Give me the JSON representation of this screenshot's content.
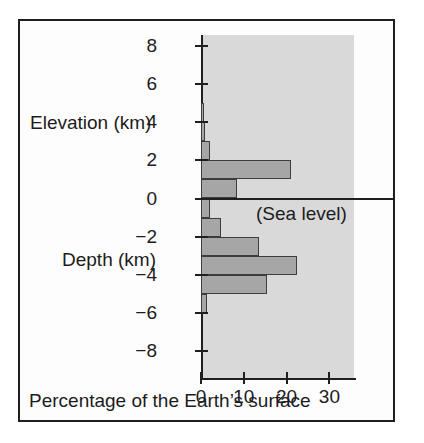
{
  "chart_data": {
    "type": "bar",
    "orientation": "horizontal",
    "title": "",
    "xlabel": "Percentage of the Earth's surface",
    "ylabel_upper": "Elevation (km)",
    "ylabel_lower": "Depth (km)",
    "xlim": [
      0,
      36
    ],
    "ylim": [
      -9,
      9
    ],
    "xticks": [
      0,
      10,
      20,
      30
    ],
    "xtick_labels": [
      "0",
      "10",
      "20",
      "30"
    ],
    "yticks": [
      8,
      6,
      4,
      2,
      0,
      -2,
      -4,
      -6,
      -8
    ],
    "ytick_labels": [
      "8",
      "6",
      "4",
      "2",
      "0",
      "−2",
      "−4",
      "−6",
      "−8"
    ],
    "grid": false,
    "legend": "none",
    "annotations": [
      {
        "text": "(Sea level)",
        "y": 0
      }
    ],
    "bins": [
      {
        "label": "5 to 4",
        "y_low": 4,
        "y_high": 5,
        "value": 0.8
      },
      {
        "label": "4 to 3",
        "y_low": 3,
        "y_high": 4,
        "value": 1.0
      },
      {
        "label": "3 to 2",
        "y_low": 2,
        "y_high": 3,
        "value": 2.2
      },
      {
        "label": "2 to 1",
        "y_low": 1,
        "y_high": 2,
        "value": 21.0
      },
      {
        "label": "1 to 0",
        "y_low": 0,
        "y_high": 1,
        "value": 8.5
      },
      {
        "label": "0 to -1",
        "y_low": -1,
        "y_high": 0,
        "value": 2.0
      },
      {
        "label": "-1 to -2",
        "y_low": -2,
        "y_high": -1,
        "value": 4.7
      },
      {
        "label": "-2 to -3",
        "y_low": -3,
        "y_high": -2,
        "value": 13.5
      },
      {
        "label": "-3 to -4",
        "y_low": -4,
        "y_high": -3,
        "value": 22.4
      },
      {
        "label": "-4 to -5",
        "y_low": -5,
        "y_high": -4,
        "value": 15.5
      },
      {
        "label": "-5 to -6",
        "y_low": -6,
        "y_high": -5,
        "value": 1.4
      }
    ],
    "colors": {
      "bar_fill": "#a6a6a6",
      "bar_edge": "#3d3d3d",
      "plot_background": "#d9d9d9",
      "axis": "#1f1f1f",
      "frame": "#1f1f1f",
      "text": "#1c1c1c",
      "page_background": "#ffffff"
    }
  },
  "labels": {
    "elevation": "Elevation (km)",
    "depth": "Depth (km)",
    "sea_level": "(Sea level)",
    "caption": "Percentage of the Earth’s surface"
  }
}
